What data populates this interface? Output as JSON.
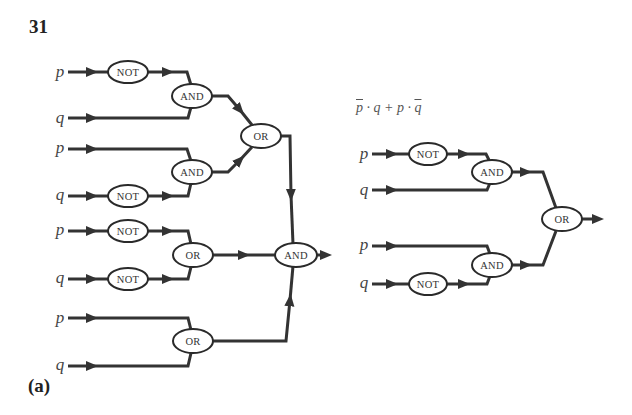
{
  "problem_number": "31",
  "part_label": "(a)",
  "formula": {
    "t1": "p",
    "op1": " · q + p · ",
    "t2": "q",
    "full_text": "p̄ · q + p · q̄"
  },
  "colors": {
    "line": "#333333",
    "gate_stroke": "#2a2a2a",
    "background": "#ffffff"
  },
  "left_circuit": {
    "inputs": [
      "p",
      "q",
      "p",
      "q",
      "p",
      "q",
      "p",
      "q"
    ],
    "gates": {
      "not1": "NOT",
      "not2": "NOT",
      "not3": "NOT",
      "not4": "NOT",
      "and1": "AND",
      "and2": "AND",
      "or_top": "OR",
      "or_mid": "OR",
      "or_bot": "OR",
      "and_final": "AND"
    }
  },
  "right_circuit": {
    "inputs": [
      "p",
      "q",
      "p",
      "q"
    ],
    "gates": {
      "not1": "NOT",
      "not2": "NOT",
      "and1": "AND",
      "and2": "AND",
      "or_final": "OR"
    }
  }
}
